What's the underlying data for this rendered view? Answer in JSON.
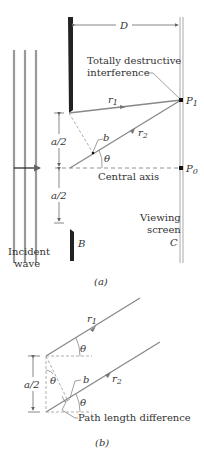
{
  "figure_a": {
    "caption": "(a)",
    "distance_label": "D",
    "annotation_line1": "Totally destructive",
    "annotation_line2": "interference",
    "ray1_label": "r",
    "ray1_sub": "1",
    "ray2_label": "r",
    "ray2_sub": "2",
    "point1_label": "P",
    "point1_sub": "1",
    "point0_label": "P",
    "point0_sub": "0",
    "b_label": "b",
    "theta_label": "θ",
    "half_width_top": "a/2",
    "half_width_bottom": "a/2",
    "axis_label": "Central axis",
    "screen_label_line1": "Viewing",
    "screen_label_line2": "screen",
    "screen_letter": "C",
    "barrier_letter": "B",
    "wave_label_line1": "Incident",
    "wave_label_line2": "wave"
  },
  "figure_b": {
    "caption": "(b)",
    "ray1_label": "r",
    "ray1_sub": "1",
    "ray2_label": "r",
    "ray2_sub": "2",
    "b_label": "b",
    "theta_top": "θ",
    "theta_mid": "θ",
    "theta_bottom": "θ",
    "half_width": "a/2",
    "path_label": "Path length difference"
  },
  "colors": {
    "ray": "#8a8a8a",
    "barrier": "#222222",
    "dashed": "#777777",
    "text": "#333333"
  }
}
